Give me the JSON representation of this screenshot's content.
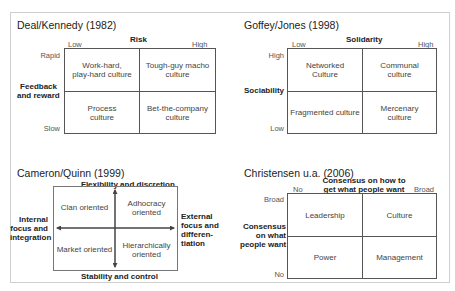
{
  "panels": {
    "deal_kennedy": {
      "title": "Deal/Kennedy (1982)",
      "x_axis": {
        "label": "Risk",
        "low": "Low",
        "high": "High"
      },
      "y_axis": {
        "label_line1": "Feedback",
        "label_line2": "and reward",
        "top": "Rapid",
        "bottom": "Slow"
      },
      "cells": {
        "top_left": {
          "line1": "Work-hard,",
          "line2": "play-hard culture"
        },
        "top_right": {
          "line1": "Tough-guy macho",
          "line2": "culture"
        },
        "bottom_left": {
          "line1": "Process",
          "line2": "culture"
        },
        "bottom_right": {
          "line1": "Bet-the-company",
          "line2": "culture"
        }
      }
    },
    "goffey_jones": {
      "title": "Goffey/Jones (1998)",
      "x_axis": {
        "label": "Solidarity",
        "low": "Low",
        "high": "High"
      },
      "y_axis": {
        "label": "Sociability",
        "top": "High",
        "bottom": "Low"
      },
      "cells": {
        "top_left": {
          "line1": "Networked",
          "line2": "Culture"
        },
        "top_right": {
          "line1": "Communal",
          "line2": "culture"
        },
        "bottom_left": {
          "line1": "Fragmented culture",
          "line2": ""
        },
        "bottom_right": {
          "line1": "Mercenary",
          "line2": "culture"
        }
      }
    },
    "cameron_quinn": {
      "title": "Cameron/Quinn (1999)",
      "top_label": "Flexibility and discretion",
      "bottom_label": "Stability and control",
      "left_label": {
        "line1": "Internal",
        "line2": "focus and",
        "line3": "integration"
      },
      "right_label": {
        "line1": "External",
        "line2": "focus and",
        "line3": "differen-",
        "line4": "tiation"
      },
      "cells": {
        "top_left": {
          "line1": "Clan oriented",
          "line2": ""
        },
        "top_right": {
          "line1": "Adhocracy",
          "line2": "oriented"
        },
        "bottom_left": {
          "line1": "Market oriented",
          "line2": ""
        },
        "bottom_right": {
          "line1": "Hierarchically",
          "line2": "oriented"
        }
      }
    },
    "christensen": {
      "title": "Christensen u.a. (2006)",
      "x_axis": {
        "label_line1": "Consensus on how to",
        "label_line2": "get what people want",
        "low": "No",
        "high": "Broad"
      },
      "y_axis": {
        "label_line1": "Consensus",
        "label_line2": "on what",
        "label_line3": "people want",
        "top": "Broad",
        "bottom": "No"
      },
      "cells": {
        "top_left": {
          "line1": "Leadership",
          "line2": ""
        },
        "top_right": {
          "line1": "Culture",
          "line2": ""
        },
        "bottom_left": {
          "line1": "Power",
          "line2": ""
        },
        "bottom_right": {
          "line1": "Management",
          "line2": ""
        }
      }
    }
  }
}
